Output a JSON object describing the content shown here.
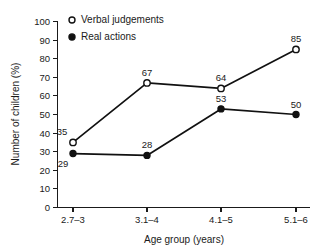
{
  "chart_data": {
    "type": "line",
    "title": "",
    "subtitle": "",
    "xlabel": "Age group (years)",
    "ylabel": "Number of children (%)",
    "categories": [
      "2.7–3",
      "3.1–4",
      "4.1–5",
      "5.1–6"
    ],
    "ylim": [
      0,
      100
    ],
    "yticks": [
      0,
      10,
      20,
      30,
      40,
      50,
      60,
      70,
      80,
      90,
      100
    ],
    "ytick_labels": [
      "0",
      "10",
      "20",
      "30",
      "40",
      "50",
      "60",
      "70",
      "80",
      "90",
      "100"
    ],
    "grid": false,
    "legend_position": "top-left-inside",
    "series": [
      {
        "name": "Verbal judgements",
        "marker": "open-circle",
        "values": [
          35,
          67,
          64,
          85
        ],
        "value_labels": [
          "35",
          "67",
          "64",
          "85"
        ],
        "label_positions": [
          "above",
          "above",
          "above",
          "above"
        ]
      },
      {
        "name": "Real actions",
        "marker": "filled-circle",
        "values": [
          29,
          28,
          53,
          50
        ],
        "value_labels": [
          "29",
          "28",
          "53",
          "50"
        ],
        "label_positions": [
          "below",
          "above",
          "above",
          "above"
        ]
      }
    ],
    "colors": {
      "line": "#111111",
      "marker_open_fill": "#ffffff",
      "marker_filled_fill": "#111111",
      "axis": "#1a1a1a",
      "text": "#1a1a1a",
      "background": "#ffffff"
    }
  },
  "legend": {
    "items": [
      {
        "label": "Verbal judgements",
        "marker": "open-circle"
      },
      {
        "label": "Real actions",
        "marker": "filled-circle"
      }
    ]
  }
}
